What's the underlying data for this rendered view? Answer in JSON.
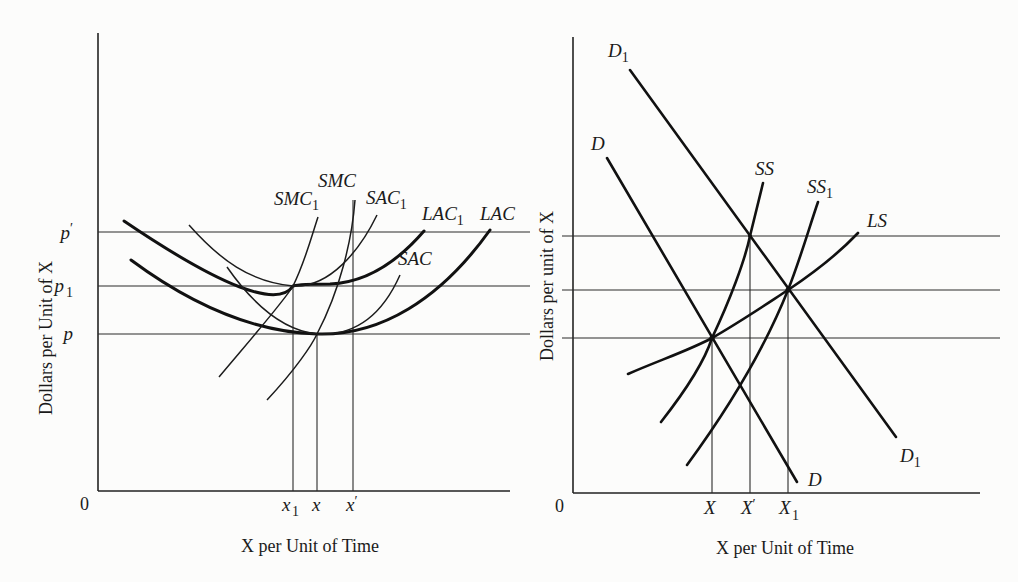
{
  "left_panel": {
    "y_axis_label": "Dollars per Unit of X",
    "x_axis_label": "X per Unit of Time",
    "origin_label": "0",
    "price_levels": [
      {
        "base": "p",
        "sup": "′",
        "sub": ""
      },
      {
        "base": "p",
        "sup": "",
        "sub": "1"
      },
      {
        "base": "p",
        "sup": "",
        "sub": ""
      }
    ],
    "quantity_levels": [
      {
        "base": "x",
        "sup": "",
        "sub": "1"
      },
      {
        "base": "x",
        "sup": "",
        "sub": ""
      },
      {
        "base": "x",
        "sup": "′",
        "sub": ""
      }
    ],
    "curves": [
      {
        "base": "SMC",
        "sub": "1"
      },
      {
        "base": "SMC",
        "sub": ""
      },
      {
        "base": "SAC",
        "sub": "1"
      },
      {
        "base": "LAC",
        "sub": "1"
      },
      {
        "base": "LAC",
        "sub": ""
      },
      {
        "base": "SAC",
        "sub": ""
      }
    ]
  },
  "right_panel": {
    "y_axis_label": "Dollars per unit of X",
    "x_axis_label": "X per Unit of Time",
    "origin_label": "0",
    "quantity_levels": [
      {
        "base": "X",
        "sup": "",
        "sub": ""
      },
      {
        "base": "X",
        "sup": "′",
        "sub": ""
      },
      {
        "base": "X",
        "sup": "",
        "sub": "1"
      }
    ],
    "curves": [
      {
        "base": "D",
        "sub": "1",
        "position": "top"
      },
      {
        "base": "D",
        "sub": "",
        "position": "top"
      },
      {
        "base": "SS",
        "sub": ""
      },
      {
        "base": "SS",
        "sub": "1"
      },
      {
        "base": "LS",
        "sub": ""
      },
      {
        "base": "D",
        "sub": "",
        "position": "bottom"
      },
      {
        "base": "D",
        "sub": "1",
        "position": "bottom"
      }
    ]
  }
}
